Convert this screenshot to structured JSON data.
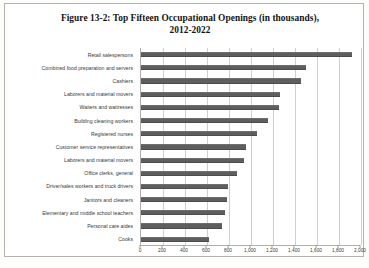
{
  "figure": {
    "title_line1": "Figure 13-2: Top Fifteen Occupational Openings (in thousands),",
    "title_line2": "2012-2022"
  },
  "chart_data": {
    "type": "bar",
    "orientation": "horizontal",
    "title": "Figure 13-2: Top Fifteen Occupational Openings (in thousands), 2012-2022",
    "xlabel": "",
    "ylabel": "",
    "xlim": [
      0,
      2000
    ],
    "xticks": [
      0,
      200,
      400,
      600,
      800,
      1000,
      1200,
      1400,
      1600,
      1800,
      2000
    ],
    "xtick_labels": [
      "0",
      "200",
      "400",
      "600",
      "800",
      "1,000",
      "1,200",
      "1,400",
      "1,600",
      "1,800",
      "2,000"
    ],
    "grid": true,
    "legend": false,
    "bar_color": "#5e5e5e",
    "categories": [
      "Retail salespersons",
      "Combined food preparation and servers",
      "Cashiers",
      "Laborers and material movers",
      "Waiters and waitresses",
      "Building cleaning workers",
      "Registered nurses",
      "Customer service representatives",
      "Laborers and material movers",
      "Office clerks, general",
      "Driver/sales workers and truck drivers",
      "Janitors and cleaners",
      "Elementary and middle school teachers",
      "Personal care aides",
      "Cooks"
    ],
    "values": [
      1920,
      1500,
      1450,
      1260,
      1250,
      1150,
      1050,
      950,
      940,
      870,
      790,
      780,
      760,
      740,
      620
    ]
  }
}
